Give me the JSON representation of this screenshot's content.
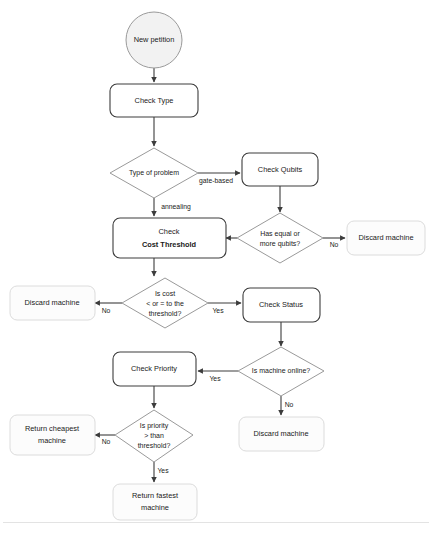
{
  "diagram": {
    "colors": {
      "node_border": "#3c3c3c",
      "soft_border": "#dcdcdc",
      "decision_border": "#9a9a9a",
      "start_fill": "#f2f2f2",
      "node_fill": "#ffffff",
      "text": "#1a1a1a",
      "divider": "#e3e3e3"
    },
    "nodes": {
      "start": {
        "label": "New petition",
        "shape": "ellipse"
      },
      "check_type": {
        "label_plain": "Check ",
        "label_bold": "Type",
        "shape": "process"
      },
      "type_of_problem": {
        "label": "Type of problem",
        "shape": "decision"
      },
      "check_qubits": {
        "label_plain": "Check ",
        "label_bold": "Qubits",
        "shape": "process"
      },
      "has_qubits": {
        "line1": "Has equal or",
        "line2": "more qubits?",
        "shape": "decision"
      },
      "discard_qubits": {
        "label": "Discard machine",
        "shape": "terminal"
      },
      "check_cost_threshold": {
        "line1": "Check",
        "line2": "Cost Threshold",
        "shape": "process"
      },
      "is_cost": {
        "line1": "Is cost",
        "line2": "< or = to the",
        "line3": "threshold?",
        "shape": "decision"
      },
      "discard_cost": {
        "label": "Discard machine",
        "shape": "terminal"
      },
      "check_status": {
        "label_plain": "Check ",
        "label_bold": "Status",
        "shape": "process"
      },
      "is_machine_online": {
        "label": "Is machine online?",
        "shape": "decision"
      },
      "discard_offline": {
        "label": "Discard machine",
        "shape": "terminal"
      },
      "check_priority": {
        "label_plain": "Check ",
        "label_bold": "Priority",
        "shape": "process"
      },
      "is_priority": {
        "line1": "Is priority",
        "line2": "> than",
        "line3": "threshold?",
        "shape": "decision"
      },
      "return_cheapest": {
        "line1": "Return cheapest",
        "line2": "machine",
        "shape": "terminal"
      },
      "return_fastest": {
        "line1": "Return fastest",
        "line2": "machine",
        "shape": "terminal"
      }
    },
    "edge_labels": {
      "gate_based": "gate-based",
      "annealing": "annealing",
      "qubits_yes": "Yes",
      "qubits_no": "No",
      "cost_yes": "Yes",
      "cost_no": "No",
      "online_yes": "Yes",
      "online_no": "No",
      "priority_yes": "Yes",
      "priority_no": "No"
    }
  }
}
